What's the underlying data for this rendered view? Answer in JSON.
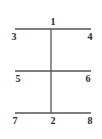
{
  "diagram": {
    "stroke_color": "#555555",
    "label_color": "#2a2a2a",
    "lines": {
      "top": {
        "x1": 15,
        "x2": 91,
        "y": 29
      },
      "middle": {
        "x1": 15,
        "x2": 91,
        "y": 71
      },
      "bottom": {
        "x1": 15,
        "x2": 91,
        "y": 113
      },
      "vertical": {
        "x": 51,
        "y1": 29,
        "y2": 113
      }
    },
    "labels": {
      "n1": "1",
      "n2": "2",
      "n3": "3",
      "n4": "4",
      "n5": "5",
      "n6": "6",
      "n7": "7",
      "n8": "8"
    }
  }
}
